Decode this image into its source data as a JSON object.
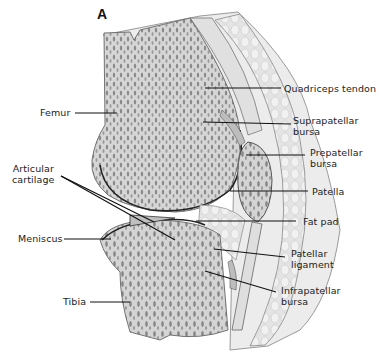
{
  "figure": {
    "panel_letter": "A",
    "colors": {
      "background": "#ffffff",
      "bone_fill": "#d9d9d9",
      "bone_pores": "#8c8c8c",
      "soft_tissue": "#e6e6e6",
      "outline": "#555555",
      "leader_lines": "#111111",
      "label_text": "#222222"
    }
  },
  "labels": {
    "left": [
      {
        "id": "femur",
        "text": "Femur"
      },
      {
        "id": "articular_cartilage",
        "text": "Articular\ncartilage"
      },
      {
        "id": "meniscus",
        "text": "Meniscus"
      },
      {
        "id": "tibia",
        "text": "Tibia"
      }
    ],
    "right": [
      {
        "id": "quadriceps_tendon",
        "text": "Quadriceps tendon"
      },
      {
        "id": "suprapatellar_bursa",
        "text": "Suprapatellar\nbursa"
      },
      {
        "id": "prepatellar_bursa",
        "text": "Prepatellar\nbursa"
      },
      {
        "id": "patella",
        "text": "Patella"
      },
      {
        "id": "fat_pad",
        "text": "Fat pad"
      },
      {
        "id": "patellar_ligament",
        "text": "Patellar\nligament"
      },
      {
        "id": "infrapatellar_bursa",
        "text": "Infrapatellar\nbursa"
      }
    ]
  }
}
